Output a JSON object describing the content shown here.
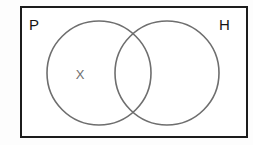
{
  "diagram": {
    "type": "venn",
    "universe": {
      "name": "universal-set-rectangle",
      "border_color": "#1c1c1c",
      "fill_color": "#ffffff"
    },
    "sets": [
      {
        "id": "P",
        "label": "P",
        "position": "left",
        "stroke_color": "#6e6e6e",
        "center_x": 99,
        "center_y": 73,
        "radius": 52
      },
      {
        "id": "H",
        "label": "H",
        "position": "right",
        "stroke_color": "#6e6e6e",
        "center_x": 167,
        "center_y": 73,
        "radius": 52
      }
    ],
    "markers": [
      {
        "label": "X",
        "region": "P-only",
        "color": "#6f6f6f",
        "x": 79,
        "y": 75
      }
    ]
  }
}
